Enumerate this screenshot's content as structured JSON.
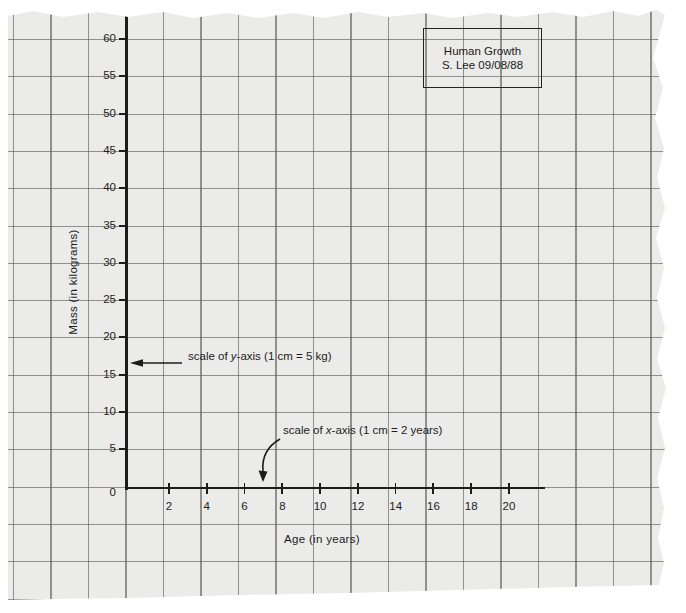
{
  "title_box": {
    "line1": "Human Growth",
    "line2": "S. Lee 09/08/88"
  },
  "y_axis": {
    "label": "Mass (in kilograms)",
    "tick_labels": [
      "60",
      "55",
      "50",
      "45",
      "40",
      "35",
      "30",
      "25",
      "20",
      "15",
      "10",
      "5"
    ],
    "origin_label": "0"
  },
  "x_axis": {
    "label": "Age (in years)",
    "tick_labels": [
      "2",
      "4",
      "6",
      "8",
      "10",
      "12",
      "14",
      "16",
      "18",
      "20"
    ]
  },
  "annotations": {
    "y_scale": {
      "prefix": "scale of ",
      "variable": "y",
      "suffix": "-axis (1 cm = 5 kg)"
    },
    "x_scale": {
      "prefix": "scale of ",
      "variable": "x",
      "suffix": "-axis (1 cm = 2 years)"
    }
  },
  "colors": {
    "paper": "#ebebe9",
    "grid_line": "#8d8d89",
    "ink": "#1c1c1c",
    "background": "#ffffff"
  },
  "chart_data": {
    "type": "scatter",
    "title": "Human Growth",
    "subtitle": "S. Lee 09/08/88",
    "xlabel": "Age (in years)",
    "ylabel": "Mass (in kilograms)",
    "xlim": [
      0,
      22
    ],
    "ylim": [
      0,
      62
    ],
    "x_ticks": [
      2,
      4,
      6,
      8,
      10,
      12,
      14,
      16,
      18,
      20
    ],
    "y_ticks": [
      0,
      5,
      10,
      15,
      20,
      25,
      30,
      35,
      40,
      45,
      50,
      55,
      60
    ],
    "x_scale_note": "1 cm = 2 years",
    "y_scale_note": "1 cm = 5 kg",
    "grid": true,
    "legend": false,
    "series": []
  }
}
